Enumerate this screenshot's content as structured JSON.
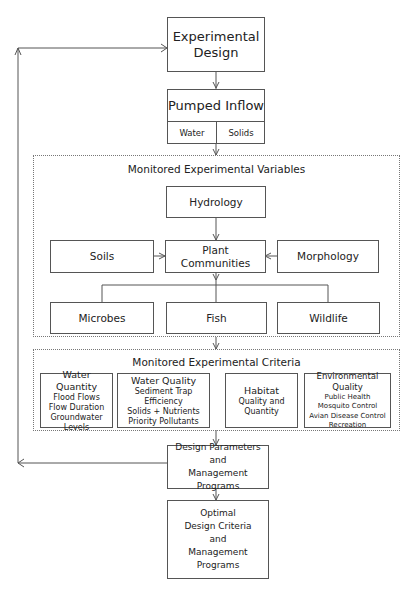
{
  "diagram": {
    "experimental_design": {
      "lines": [
        "Experimental",
        "Design"
      ]
    },
    "pumped_inflow": {
      "title": "Pumped Inflow",
      "parts": [
        "Water",
        "Solids"
      ]
    },
    "variables": {
      "title": "Monitored Experimental Variables",
      "hydrology": "Hydrology",
      "soils": "Soils",
      "plant_communities": "Plant Communities",
      "morphology": "Morphology",
      "microbes": "Microbes",
      "fish": "Fish",
      "wildlife": "Wildlife"
    },
    "criteria": {
      "title": "Monitored Experimental Criteria",
      "boxes": [
        {
          "title": "Water Quantity",
          "items": [
            "Flood Flows",
            "Flow Duration",
            "Groundwater Levels"
          ]
        },
        {
          "title": "Water Quality",
          "items": [
            "Sediment Trap Efficiency",
            "Solids + Nutrients",
            "Priority Pollutants"
          ]
        },
        {
          "title": "Habitat",
          "items": [
            "Quality and",
            "Quantity"
          ]
        },
        {
          "title": "Environmental Quality",
          "items": [
            "Public Health",
            "Mosquito Control",
            "Avian Disease Control",
            "Recreation"
          ]
        }
      ]
    },
    "design_parameters": {
      "lines": [
        "Design Parameters",
        "and",
        "Management Programs"
      ]
    },
    "optimal": {
      "lines": [
        "Optimal",
        "Design Criteria",
        "and",
        "Management Programs"
      ]
    },
    "colors": {
      "line": "#555555",
      "text": "#222222",
      "background": "#ffffff"
    }
  }
}
